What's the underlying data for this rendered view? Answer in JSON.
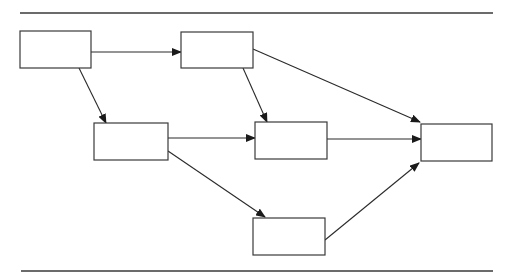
{
  "diagram": {
    "type": "flow-network",
    "colors": {
      "stroke": "#2a2a2a",
      "background": "#ffffff"
    },
    "rules": [
      {
        "id": "top-rule",
        "x1": 20,
        "y1": 13,
        "x2": 493,
        "y2": 13
      },
      {
        "id": "bottom-rule",
        "x1": 21,
        "y1": 271,
        "x2": 493,
        "y2": 271
      }
    ],
    "nodes": [
      {
        "id": "A",
        "label": "",
        "x": 20,
        "y": 31,
        "w": 71,
        "h": 37
      },
      {
        "id": "B",
        "label": "",
        "x": 181,
        "y": 32,
        "w": 72,
        "h": 36
      },
      {
        "id": "C",
        "label": "",
        "x": 94,
        "y": 123,
        "w": 74,
        "h": 37
      },
      {
        "id": "D",
        "label": "",
        "x": 255,
        "y": 122,
        "w": 72,
        "h": 37
      },
      {
        "id": "E",
        "label": "",
        "x": 421,
        "y": 124,
        "w": 71,
        "h": 37
      },
      {
        "id": "F",
        "label": "",
        "x": 253,
        "y": 218,
        "w": 72,
        "h": 37
      }
    ],
    "edges": [
      {
        "from": "A",
        "to": "B",
        "x1": 91,
        "y1": 52,
        "x2": 181,
        "y2": 52
      },
      {
        "from": "A",
        "to": "C",
        "x1": 79,
        "y1": 68,
        "x2": 106,
        "y2": 123
      },
      {
        "from": "B",
        "to": "D",
        "x1": 243,
        "y1": 68,
        "x2": 267,
        "y2": 122
      },
      {
        "from": "B",
        "to": "E",
        "x1": 253,
        "y1": 49,
        "x2": 420,
        "y2": 122
      },
      {
        "from": "C",
        "to": "D",
        "x1": 168,
        "y1": 138,
        "x2": 255,
        "y2": 138
      },
      {
        "from": "C",
        "to": "F",
        "x1": 168,
        "y1": 151,
        "x2": 265,
        "y2": 217
      },
      {
        "from": "D",
        "to": "E",
        "x1": 327,
        "y1": 139,
        "x2": 421,
        "y2": 139
      },
      {
        "from": "F",
        "to": "E",
        "x1": 325,
        "y1": 240,
        "x2": 419,
        "y2": 163
      }
    ]
  }
}
